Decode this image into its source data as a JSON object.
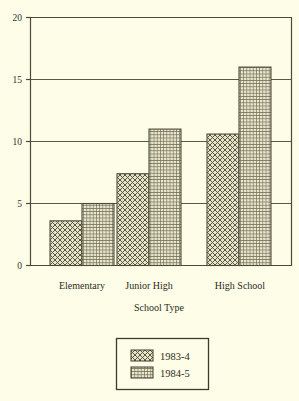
{
  "chart_data": {
    "type": "bar",
    "title": "",
    "subtitle": "",
    "xlabel": "School Type",
    "ylabel": "",
    "categories": [
      "Elementary",
      "Junior High",
      "High School"
    ],
    "series": [
      {
        "name": "1983-4",
        "values": [
          3.6,
          7.4,
          10.6
        ],
        "pattern": "diagonal-crosshatch"
      },
      {
        "name": "1984-5",
        "values": [
          5.0,
          11.0,
          16.0
        ],
        "pattern": "fine-grid-hatch"
      }
    ],
    "ylim": [
      0,
      20
    ],
    "ytick_labels": [
      "0",
      "5",
      "10",
      "15",
      "20"
    ],
    "ytick_values": [
      0,
      5,
      10,
      15,
      20
    ],
    "grid": true,
    "legend_position": "below-center",
    "legend_entries": [
      "1983-4",
      "1984-5"
    ],
    "colors": {
      "background": "#fdfde8",
      "axis": "#4a4a38",
      "grid": "#5a5a44",
      "bar_fill": "#d8d6b8",
      "bar_outline": "#4a4a38",
      "text": "#2b2b20"
    }
  },
  "axis": {
    "y_ticks": [
      {
        "label": "20",
        "value": 20
      },
      {
        "label": "15",
        "value": 15
      },
      {
        "label": "10",
        "value": 10
      },
      {
        "label": "5",
        "value": 5
      },
      {
        "label": "0",
        "value": 0
      }
    ],
    "x_ticks": [
      {
        "label": "Elementary"
      },
      {
        "label": "Junior High"
      },
      {
        "label": "High School"
      }
    ],
    "x_title": "School Type"
  },
  "legend": {
    "items": [
      {
        "label": "1983-4"
      },
      {
        "label": "1984-5"
      }
    ]
  }
}
